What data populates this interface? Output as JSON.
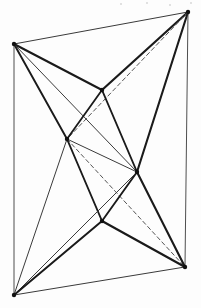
{
  "figure": {
    "canvas": {
      "width": 201,
      "height": 308
    },
    "background_color": "#fdfdfd",
    "ink_color": "#1a1a1a",
    "thin_ink_color": "#3a3a3a",
    "dashed_ink_color": "#555555",
    "vertex_color": "#111111",
    "vertices": [
      {
        "id": "A",
        "name": "top-left-vertex",
        "x": 14,
        "y": 44,
        "marker": true
      },
      {
        "id": "B",
        "name": "top-right-vertex",
        "x": 188,
        "y": 12,
        "marker": true
      },
      {
        "id": "C",
        "name": "upper-middle-vertex",
        "x": 102,
        "y": 90,
        "marker": true
      },
      {
        "id": "D",
        "name": "left-interior-vertex",
        "x": 67,
        "y": 139,
        "marker": true
      },
      {
        "id": "E",
        "name": "right-interior-vertex",
        "x": 137,
        "y": 172,
        "marker": true
      },
      {
        "id": "F",
        "name": "lower-middle-vertex",
        "x": 102,
        "y": 221,
        "marker": true
      },
      {
        "id": "G",
        "name": "bottom-left-vertex",
        "x": 14,
        "y": 295,
        "marker": true
      },
      {
        "id": "H",
        "name": "bottom-right-vertex",
        "x": 185,
        "y": 267,
        "marker": true
      }
    ],
    "edges": [
      {
        "from": "A",
        "to": "B",
        "style": "thin",
        "width": 1.0
      },
      {
        "from": "A",
        "to": "C",
        "style": "thick",
        "width": 2.1
      },
      {
        "from": "A",
        "to": "D",
        "style": "thick",
        "width": 1.9
      },
      {
        "from": "A",
        "to": "E",
        "style": "thin",
        "width": 1.0
      },
      {
        "from": "A",
        "to": "G",
        "style": "thin",
        "width": 0.9
      },
      {
        "from": "B",
        "to": "C",
        "style": "thick",
        "width": 2.2
      },
      {
        "from": "B",
        "to": "E",
        "style": "thick",
        "width": 2.1
      },
      {
        "from": "B",
        "to": "D",
        "style": "dashed",
        "width": 1.0
      },
      {
        "from": "B",
        "to": "H",
        "style": "thin",
        "width": 0.9
      },
      {
        "from": "C",
        "to": "D",
        "style": "thick",
        "width": 1.8
      },
      {
        "from": "C",
        "to": "E",
        "style": "thick",
        "width": 1.9
      },
      {
        "from": "D",
        "to": "E",
        "style": "thin",
        "width": 1.0
      },
      {
        "from": "D",
        "to": "F",
        "style": "thick",
        "width": 1.9
      },
      {
        "from": "D",
        "to": "G",
        "style": "thin",
        "width": 1.0
      },
      {
        "from": "D",
        "to": "H",
        "style": "dashed",
        "width": 1.0
      },
      {
        "from": "E",
        "to": "F",
        "style": "thick",
        "width": 1.9
      },
      {
        "from": "E",
        "to": "G",
        "style": "thin",
        "width": 1.0
      },
      {
        "from": "E",
        "to": "H",
        "style": "thick",
        "width": 2.1
      },
      {
        "from": "F",
        "to": "G",
        "style": "thick",
        "width": 2.0
      },
      {
        "from": "F",
        "to": "H",
        "style": "thick",
        "width": 2.2
      },
      {
        "from": "G",
        "to": "H",
        "style": "thin",
        "width": 1.0
      }
    ],
    "dash_pattern": "4 3",
    "specks": [
      {
        "name": "scan-speck",
        "x": 120,
        "y": 3,
        "size": 2
      },
      {
        "name": "scan-speck",
        "x": 146,
        "y": 2,
        "size": 2
      },
      {
        "name": "scan-speck",
        "x": 169,
        "y": 4,
        "size": 2
      },
      {
        "name": "scan-speck",
        "x": 190,
        "y": 2,
        "size": 2
      }
    ]
  }
}
